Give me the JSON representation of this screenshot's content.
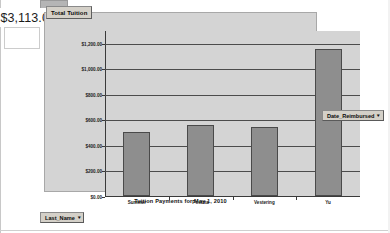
{
  "window": {
    "value_cell": "$3,113.00"
  },
  "series_button": {
    "label": "Total Tuition",
    "caret": "▾"
  },
  "filters": [
    {
      "name": "date-reimbursed",
      "label": "Date_Reimbursed",
      "caret": "▾"
    },
    {
      "name": "last-name",
      "label": "Last_Name",
      "caret": "▾"
    }
  ],
  "chart_data": {
    "type": "bar",
    "title": "",
    "xlabel": "Tuition Payments for May 1, 2010",
    "ylabel": "",
    "categories": [
      "Summer",
      "Postma",
      "Vestering",
      "Yu"
    ],
    "values": [
      500,
      560,
      540,
      1150
    ],
    "series": [
      {
        "name": "Total Tuition",
        "values": [
          500,
          560,
          540,
          1150
        ]
      }
    ],
    "ylim": [
      0,
      1300
    ],
    "yticks": [
      0,
      200,
      400,
      600,
      800,
      1000,
      1200
    ],
    "ytick_labels": [
      "$0.00",
      "$200.00",
      "$400.00",
      "$600.00",
      "$800.00",
      "$1,000.00",
      "$1,200.00"
    ],
    "grid": true,
    "legend": false,
    "bar_color": "#8e8e8e",
    "plot_background": "#d4d4d4"
  }
}
